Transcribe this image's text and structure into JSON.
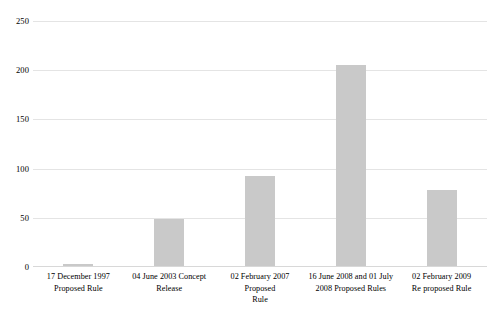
{
  "chart_data": {
    "type": "bar",
    "title": "",
    "subtitle": "",
    "xlabel": "",
    "ylabel": "",
    "ylim": [
      0,
      250
    ],
    "yticks": [
      0,
      50,
      100,
      150,
      200,
      250
    ],
    "ytick_labels": [
      "0",
      "50",
      "100",
      "150",
      "200",
      "250"
    ],
    "grid": true,
    "legend": false,
    "legend_position": "none",
    "bar_color": "#c9c9c9",
    "gridline_color": "#e4e4e4",
    "background_color": "#ffffff",
    "categories": [
      "17 December 1997 Proposed Rule",
      "04 June 2003 Concept Release",
      "02 February 2007 Proposed Rule",
      "16 June 2008 and 01 July 2008 Proposed Rules",
      "02 February 2009 Re proposed Rule"
    ],
    "category_lines": [
      [
        "17 December 1997",
        "Proposed Rule"
      ],
      [
        "04 June 2003 Concept",
        "Release"
      ],
      [
        "02 February 2007 Proposed",
        "Rule"
      ],
      [
        "16 June 2008 and 01 July",
        "2008 Proposed Rules"
      ],
      [
        "02 February 2009",
        "Re proposed Rule"
      ]
    ],
    "values": [
      2,
      48,
      92,
      205,
      78
    ]
  }
}
